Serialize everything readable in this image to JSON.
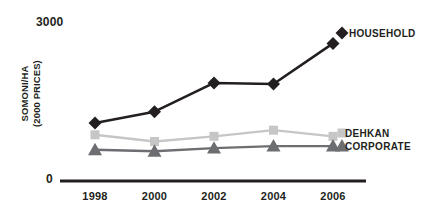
{
  "chart_data": {
    "type": "line",
    "title": "",
    "xlabel": "",
    "ylabel": "SOMONI/HA\n(2000 PRICES)",
    "ylabel_line1": "SOMONI/HA",
    "ylabel_line2": "(2000 PRICES)",
    "categories": [
      "1998",
      "2000",
      "2002",
      "2004",
      "2006"
    ],
    "x": [
      1998,
      2000,
      2002,
      2004,
      2006
    ],
    "ylim": [
      0,
      3000
    ],
    "y_ticks": [
      "0",
      "3000"
    ],
    "y_tick_min": "0",
    "y_tick_max": "3000",
    "grid": false,
    "legend_position": "right-inline",
    "series": [
      {
        "name": "HOUSEHOLD",
        "marker": "diamond",
        "color": "#231f20",
        "values": [
          1130,
          1350,
          1910,
          1890,
          2680
        ]
      },
      {
        "name": "DEHKAN",
        "marker": "square",
        "color": "#c6c6c6",
        "values": [
          900,
          770,
          870,
          990,
          870
        ]
      },
      {
        "name": "CORPORATE",
        "marker": "triangle",
        "color": "#6d6e71",
        "values": [
          610,
          580,
          640,
          680,
          680
        ]
      }
    ],
    "annotations": []
  },
  "axis": {
    "max_label": "3000",
    "zero_label": "0",
    "line_color": "#231f20"
  },
  "colors": {
    "household": "#231f20",
    "dehkan": "#c6c6c6",
    "corporate": "#6d6e71",
    "text": "#231f20",
    "background": "#ffffff"
  }
}
